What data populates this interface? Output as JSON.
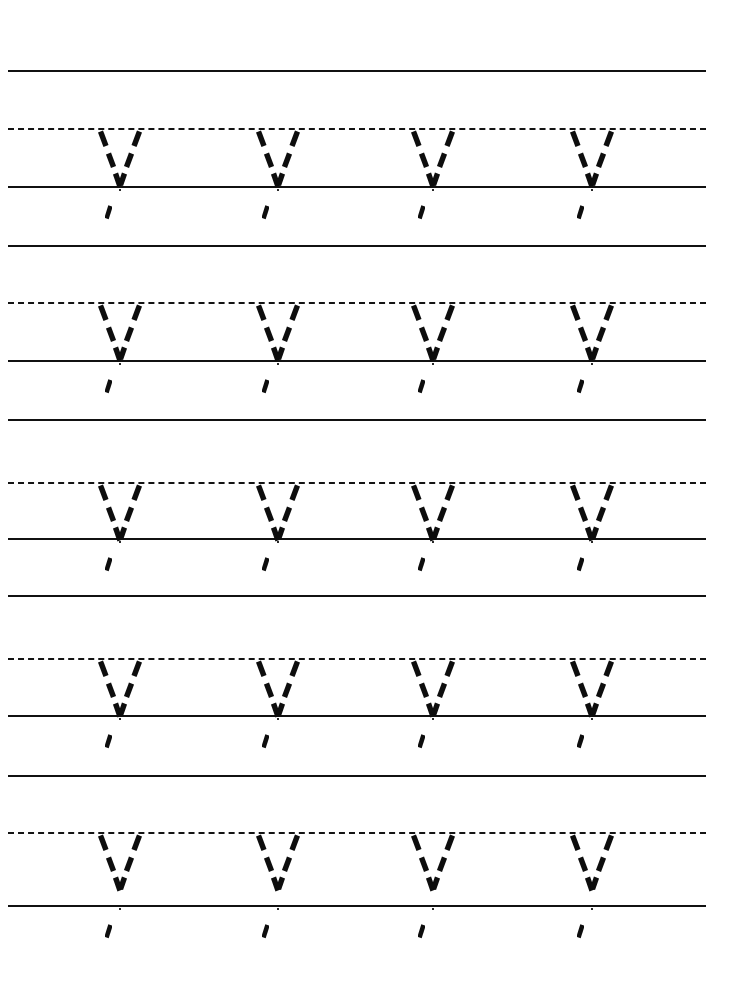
{
  "worksheet": {
    "title": "Letter V Tracing Practice Worksheet",
    "letter": "V",
    "letter_case": "uppercase",
    "page_width": 746,
    "page_height": 1005,
    "background_color": "#ffffff",
    "ink_color": "#0d0d0d",
    "rows_count": 5,
    "letters_per_row": 4,
    "total_letters": 20,
    "row_period": 174
  },
  "guides": {
    "margin_left": 8,
    "margin_right": 706,
    "line_length": 698,
    "solid_width": 2,
    "dashed_width": 2,
    "dash_length": 13,
    "dash_gap": 6,
    "solid_color": "#111111",
    "dashed_color": "#141414",
    "lines": [
      {
        "y": 70,
        "style": "solid",
        "role": "cap-line-row-1"
      },
      {
        "y": 128,
        "style": "dashed",
        "role": "mid-line-row-1"
      },
      {
        "y": 186,
        "style": "solid",
        "role": "base-line-row-1"
      },
      {
        "y": 245,
        "style": "solid",
        "role": "cap-line-row-2"
      },
      {
        "y": 302,
        "style": "dashed",
        "role": "mid-line-row-2"
      },
      {
        "y": 360,
        "style": "solid",
        "role": "base-line-row-2"
      },
      {
        "y": 419,
        "style": "solid",
        "role": "cap-line-row-3"
      },
      {
        "y": 482,
        "style": "dashed",
        "role": "mid-line-row-3"
      },
      {
        "y": 538,
        "style": "solid",
        "role": "base-line-row-3"
      },
      {
        "y": 595,
        "style": "solid",
        "role": "cap-line-row-4"
      },
      {
        "y": 658,
        "style": "dashed",
        "role": "mid-line-row-4"
      },
      {
        "y": 715,
        "style": "solid",
        "role": "base-line-row-4"
      },
      {
        "y": 775,
        "style": "solid",
        "role": "cap-line-row-5"
      },
      {
        "y": 832,
        "style": "dashed",
        "role": "mid-line-row-5"
      },
      {
        "y": 905,
        "style": "solid",
        "role": "base-line-row-5"
      }
    ]
  },
  "rows": [
    {
      "index": 1,
      "mid_y": 128,
      "base_y": 186,
      "tick_y": 205
    },
    {
      "index": 2,
      "mid_y": 302,
      "base_y": 360,
      "tick_y": 379
    },
    {
      "index": 3,
      "mid_y": 482,
      "base_y": 538,
      "tick_y": 557
    },
    {
      "index": 4,
      "mid_y": 658,
      "base_y": 715,
      "tick_y": 734
    },
    {
      "index": 5,
      "mid_y": 832,
      "base_y": 905,
      "tick_y": 924
    }
  ],
  "letter_columns": [
    {
      "index": 1,
      "center_x": 120,
      "tick_x": 105
    },
    {
      "index": 2,
      "center_x": 278,
      "tick_x": 262
    },
    {
      "index": 3,
      "center_x": 433,
      "tick_x": 418
    },
    {
      "index": 4,
      "center_x": 592,
      "tick_x": 577
    }
  ],
  "glyph": {
    "name": "dashed-letter-v",
    "top_width": 40,
    "height": 58,
    "stroke_width": 5.4,
    "dashes_per_stroke": 3,
    "strokes": [
      {
        "name": "left-diagonal",
        "from": {
          "x": -20,
          "y": 0
        },
        "to": {
          "x": 0,
          "y": 58
        },
        "segments": [
          {
            "x1": -19.5,
            "y1": 1.5,
            "x2": -14.0,
            "y2": 16.0
          },
          {
            "x1": -11.5,
            "y1": 23.5,
            "x2": -6.5,
            "y2": 37.0
          },
          {
            "x1": -4.5,
            "y1": 43.5,
            "x2": 0.0,
            "y2": 56.5
          }
        ]
      },
      {
        "name": "right-diagonal",
        "from": {
          "x": 20,
          "y": 0
        },
        "to": {
          "x": 0,
          "y": 58
        },
        "segments": [
          {
            "x1": 19.5,
            "y1": 1.5,
            "x2": 14.0,
            "y2": 16.0
          },
          {
            "x1": 11.5,
            "y1": 23.5,
            "x2": 6.5,
            "y2": 37.0
          },
          {
            "x1": 4.5,
            "y1": 43.5,
            "x2": 0.5,
            "y2": 55.0
          }
        ]
      }
    ]
  },
  "start_tick": {
    "name": "start-stroke-tick",
    "width": 7,
    "height": 15,
    "stroke_width": 4.6,
    "segment": {
      "x1": 5.5,
      "y1": 1.0,
      "x2": 1.5,
      "y2": 13.5
    }
  }
}
